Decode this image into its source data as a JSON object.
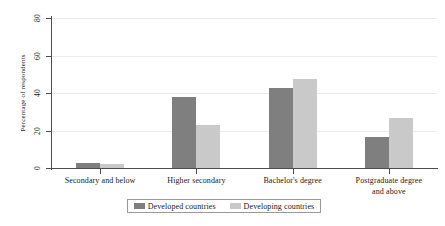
{
  "chart_data": {
    "type": "bar",
    "title": "",
    "subtitle": "",
    "xlabel": "",
    "ylabel": "Percentage of respondents",
    "categories": [
      "Secondary and below",
      "Higher secondary",
      "Bachelor's degree",
      "Postgraduate degree\nand above"
    ],
    "series": [
      {
        "name": "Developed countries",
        "color": "#7f7f7f",
        "values": [
          2.5,
          38,
          42.5,
          16.5
        ]
      },
      {
        "name": "Developing countries",
        "color": "#c9c9c9",
        "values": [
          2,
          23,
          47.5,
          26.5
        ]
      }
    ],
    "ylim": [
      0,
      80
    ],
    "yticks": [
      0,
      20,
      40,
      60,
      80
    ],
    "ytick_labels": [
      "0",
      "20",
      "40",
      "60",
      "80"
    ],
    "grid": "horizontal",
    "legend_position": "bottom",
    "background": "#ffffff",
    "axis_color": "#4d4d4d",
    "gridline_color": "#eceaea"
  },
  "legend": {
    "entries": [
      {
        "label": "Developed countries"
      },
      {
        "label": "Developing countries"
      }
    ]
  }
}
